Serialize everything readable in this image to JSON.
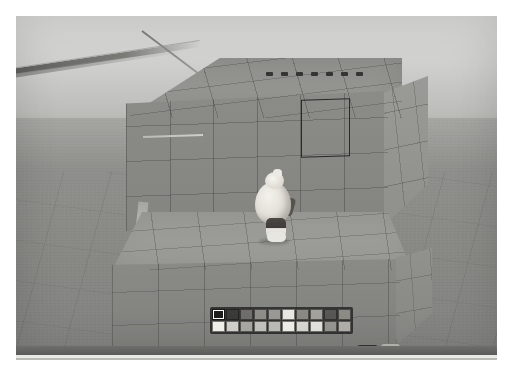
{
  "app": {
    "title": "Voxel Sandbox Builder",
    "scene_description": "Third-person view of a character standing on a large grey voxel block structure on an open plain"
  },
  "viewport": {
    "sky_color": "#d2d3d0",
    "ground_color": "#8d8d8a",
    "block_color": "#8b8b88",
    "grid_line_color": "#3c3c3a",
    "selection_outline_color": "#191919",
    "top_marks_count": 7,
    "top_mark_color": "#353533"
  },
  "player": {
    "name": "player-avatar",
    "body_color": "#e4e1da",
    "legs_color": "#3e3b39"
  },
  "palette": {
    "name": "color-palette",
    "rows": 2,
    "columns": 10,
    "selected_index": 0,
    "swatches": [
      [
        "#1d1d1b",
        "#3b3b38",
        "#6f6e6a",
        "#8e8d88",
        "#9a9994",
        "#e8e7e1",
        "#8a8984",
        "#a3a29c",
        "#585754",
        "#8c8b86"
      ],
      [
        "#f3f2ec",
        "#d2d1cb",
        "#a9a8a2",
        "#c4c3bd",
        "#bdbcb6",
        "#f0efe9",
        "#d8d7d1",
        "#e3e2dc",
        "#96958f",
        "#b1b0aa"
      ]
    ]
  },
  "hotbar": {
    "name": "item-hotbar",
    "active_slot_index": 1,
    "slots": [
      {
        "label": "",
        "icon": "paper-sheet-icon",
        "style": "light",
        "selected": false
      },
      {
        "label": "",
        "icon": "white-cube-icon",
        "style": "active",
        "selected": true
      },
      {
        "label": "",
        "icon": "dark-block-icon",
        "style": "dark",
        "selected": false
      },
      {
        "label": "",
        "icon": "ore-chunk-icon",
        "style": "dark",
        "selected": false
      },
      {
        "label": "",
        "icon": "round-block-icon",
        "style": "dark",
        "selected": false
      },
      {
        "label": "che",
        "icon": "tool-pick-icon",
        "style": "dark",
        "selected": false
      },
      {
        "label": "",
        "icon": "sphere-block-icon",
        "style": "dark",
        "selected": false
      },
      {
        "label": "",
        "icon": "wood-block-icon",
        "style": "dark",
        "selected": false
      },
      {
        "label": "",
        "icon": "crate-cube-icon",
        "style": "dark",
        "selected": false
      }
    ],
    "key_button": {
      "label": "E",
      "name": "inventory-key-button"
    },
    "more_button": {
      "label": "•••",
      "name": "more-options-button"
    }
  },
  "bottom_bar": {
    "name": "bottom-status-bar",
    "bar_color": "#62625f",
    "line_color": "#e9e9e6"
  }
}
